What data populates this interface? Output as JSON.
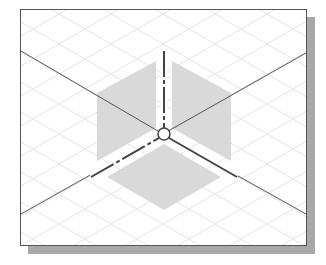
{
  "diagram": {
    "type": "isometric-workplane-view",
    "colors": {
      "frame_border": "#555555",
      "shadow": "#a8a8a8",
      "plane_fill": "#d9d9d9",
      "axis": "#444444",
      "grid": "#e6e6e6"
    },
    "elements": [
      "isometric-grid",
      "left-vertical-plane",
      "right-vertical-plane",
      "horizontal-plane",
      "vertical-axis",
      "left-axis",
      "right-axis",
      "origin-point"
    ]
  }
}
